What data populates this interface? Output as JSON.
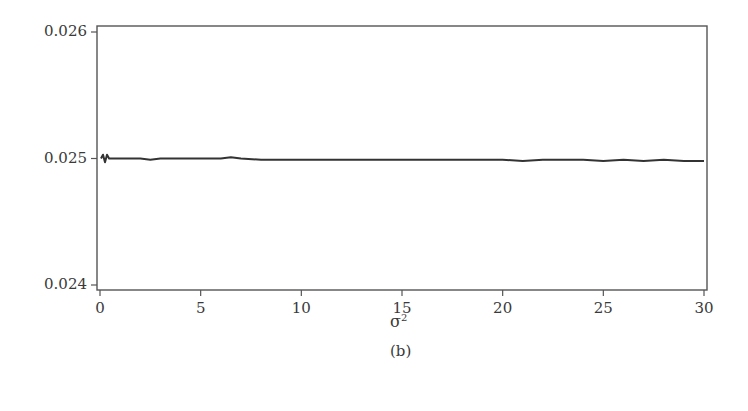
{
  "chart_data": {
    "type": "line",
    "title": "",
    "caption": "(b)",
    "xlabel": "σ²",
    "xlabel_base": "σ",
    "xlabel_sup": "2",
    "ylabel": "",
    "xlim": [
      0,
      30
    ],
    "ylim": [
      0.024,
      0.026
    ],
    "xticks": [
      0,
      5,
      10,
      15,
      20,
      25,
      30
    ],
    "xtick_labels": [
      "0",
      "5",
      "10",
      "15",
      "20",
      "25",
      "30"
    ],
    "yticks": [
      0.024,
      0.025,
      0.026
    ],
    "ytick_labels": [
      "0.024",
      "0.025",
      "0.026"
    ],
    "grid": false,
    "legend": null,
    "series": [
      {
        "name": "series-1",
        "color": "#333333",
        "x": [
          0.05,
          0.15,
          0.25,
          0.35,
          0.45,
          0.6,
          1.0,
          2.0,
          2.5,
          3.0,
          4.0,
          5.0,
          6.0,
          6.5,
          7.0,
          8.0,
          10.0,
          12.0,
          14.0,
          16.0,
          18.0,
          20.0,
          21.0,
          22.0,
          23.0,
          24.0,
          25.0,
          26.0,
          27.0,
          28.0,
          29.0,
          30.0
        ],
        "y": [
          0.025,
          0.02503,
          0.02497,
          0.02503,
          0.025,
          0.025,
          0.025,
          0.025,
          0.02499,
          0.025,
          0.025,
          0.025,
          0.025,
          0.02501,
          0.025,
          0.02499,
          0.02499,
          0.02499,
          0.02499,
          0.02499,
          0.02499,
          0.02499,
          0.02498,
          0.02499,
          0.02499,
          0.02499,
          0.02498,
          0.02499,
          0.02498,
          0.02499,
          0.02498,
          0.02498
        ]
      }
    ]
  }
}
